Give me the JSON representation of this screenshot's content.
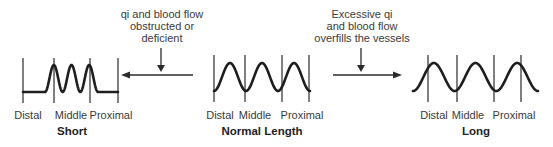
{
  "diagram": {
    "annotations": {
      "deficient": [
        "qi and blood flow",
        "obstructed or",
        "deficient"
      ],
      "excessive": [
        "Excessive qi",
        "and blood flow",
        "overfills the vessels"
      ]
    },
    "panels": [
      {
        "id": "short",
        "title": "Short",
        "positions": [
          "Distal",
          "Middle",
          "Proximal"
        ],
        "pulse_extent": "middle only",
        "cycles": 3
      },
      {
        "id": "normal",
        "title": "Normal Length",
        "positions": [
          "Distal",
          "Middle",
          "Proximal"
        ],
        "pulse_extent": "distal to proximal",
        "cycles": 3
      },
      {
        "id": "long",
        "title": "Long",
        "positions": [
          "Distal",
          "Middle",
          "Proximal"
        ],
        "pulse_extent": "beyond distal and proximal",
        "cycles": 3
      }
    ],
    "arrows": [
      {
        "id": "to-short",
        "direction": "left",
        "from": "normal",
        "to": "short"
      },
      {
        "id": "to-long",
        "direction": "right",
        "from": "normal",
        "to": "long"
      }
    ]
  }
}
